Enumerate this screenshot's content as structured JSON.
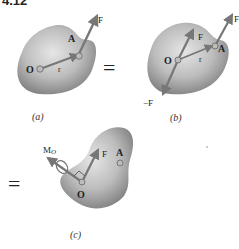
{
  "figure": {
    "number": "4.12",
    "equals_symbol": "=",
    "panels": [
      {
        "id": "a",
        "caption": "(a)",
        "labels": {
          "origin": "O",
          "point": "A",
          "position_vector": "r",
          "force": "F"
        }
      },
      {
        "id": "b",
        "caption": "(b)",
        "labels": {
          "origin": "O",
          "point": "A",
          "position_vector": "r",
          "force_at_O": "F",
          "force_at_A": "F",
          "negative_force": "−F"
        }
      },
      {
        "id": "c",
        "caption": "(c)",
        "labels": {
          "origin": "O",
          "point": "A",
          "force": "F",
          "moment": "M",
          "moment_subscript": "O"
        }
      }
    ],
    "colors": {
      "body_fill_light": "#d9d9d9",
      "body_fill_dark": "#8c8c8c",
      "arrow": "#7a7a7a",
      "text": "#222222"
    }
  }
}
